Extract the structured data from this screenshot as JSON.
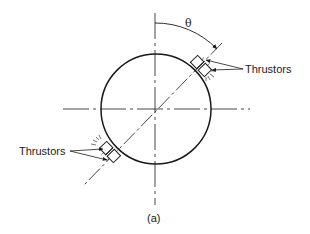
{
  "figure": {
    "caption": "(a)",
    "angle_label": "θ",
    "labels": {
      "thrustors_upper": "Thrustors",
      "thrustors_lower": "Thrustors"
    }
  },
  "colors": {
    "stroke": "#1a1a1a",
    "background": "#ffffff"
  }
}
